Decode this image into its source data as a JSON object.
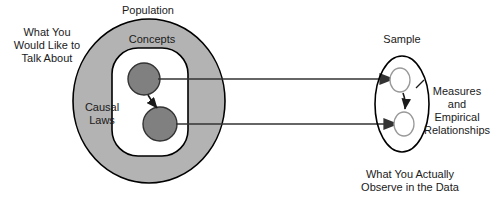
{
  "figure": {
    "title_partial": "",
    "width": 494,
    "height": 202,
    "background": "#ffffff"
  },
  "colors": {
    "population_fill": "#b3b3b3",
    "population_stroke": "#000000",
    "concepts_fill": "#ffffff",
    "concepts_stroke": "#000000",
    "concept_node_fill": "#808080",
    "concept_node_stroke": "#333333",
    "sample_stroke": "#000000",
    "sample_node_fill": "#ffffff",
    "sample_node_stroke": "#999999",
    "arrow_stroke": "#333333",
    "text": "#1a1a1a"
  },
  "labels": {
    "what_you_would_like": "What You\nWould Like to\nTalk About",
    "population": "Population",
    "concepts": "Concepts",
    "causal_laws": "Causal\nLaws",
    "sample": "Sample",
    "measures_empirical": "Measures\nand\nEmpirical\nRelationships",
    "what_you_actually": "What You Actually\nObserve in the Data"
  },
  "shapes": {
    "population_ellipse": {
      "name": "Population",
      "cx": 149,
      "cy": 101,
      "rx": 76,
      "ry": 82
    },
    "concepts_rounded_rect": {
      "name": "Concepts",
      "x": 112,
      "y": 48,
      "width": 76,
      "height": 108,
      "rx": 26
    },
    "concept_node_upper": {
      "name": "concept-node-upper",
      "cx": 144,
      "cy": 79,
      "r": 16
    },
    "concept_node_lower": {
      "name": "concept-node-lower",
      "cx": 160,
      "cy": 124,
      "r": 17
    },
    "sample_ellipse": {
      "name": "Sample",
      "cx": 402,
      "cy": 104,
      "rx": 27,
      "ry": 48
    },
    "sample_node_upper": {
      "name": "sample-node-upper",
      "cx": 400,
      "cy": 80,
      "rx": 10,
      "ry": 12
    },
    "sample_node_lower": {
      "name": "sample-node-lower",
      "cx": 404,
      "cy": 124,
      "rx": 10,
      "ry": 12
    }
  },
  "arrows": [
    {
      "name": "causal-arrow-internal",
      "from": [
        150,
        94
      ],
      "to": [
        158,
        110
      ],
      "kind": "curved-short"
    },
    {
      "name": "mapping-arrow-upper",
      "from": [
        158,
        79
      ],
      "to": [
        392,
        79
      ],
      "kind": "horizontal"
    },
    {
      "name": "mapping-arrow-lower",
      "from": [
        176,
        124
      ],
      "to": [
        396,
        124
      ],
      "kind": "horizontal"
    },
    {
      "name": "empirical-arrow-internal",
      "from": [
        404,
        92
      ],
      "to": [
        404,
        110
      ],
      "kind": "short-vertical"
    },
    {
      "name": "measures-pointer",
      "from": [
        424,
        82
      ],
      "to": [
        412,
        90
      ],
      "kind": "tick"
    }
  ]
}
